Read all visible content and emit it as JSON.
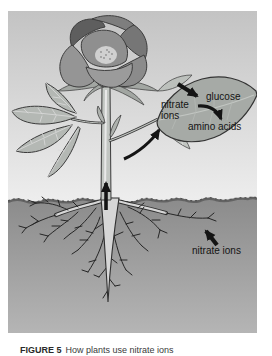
{
  "figure": {
    "labels": {
      "glucose": "glucose",
      "nitrate_ions_leaf": "nitrate ions",
      "amino_acids": "amino acids",
      "nitrate_ions_soil": "nitrate ions"
    },
    "colors": {
      "sky_top": "#c3c3c3",
      "sky_bottom": "#eeeeee",
      "soil_top": "#8b8b8b",
      "soil_bottom": "#b5b5b5",
      "ink": "#141414",
      "leaf_fill": "#a6aaa6"
    }
  },
  "caption": {
    "label": "FIGURE 5",
    "text": "How plants use nitrate ions"
  }
}
